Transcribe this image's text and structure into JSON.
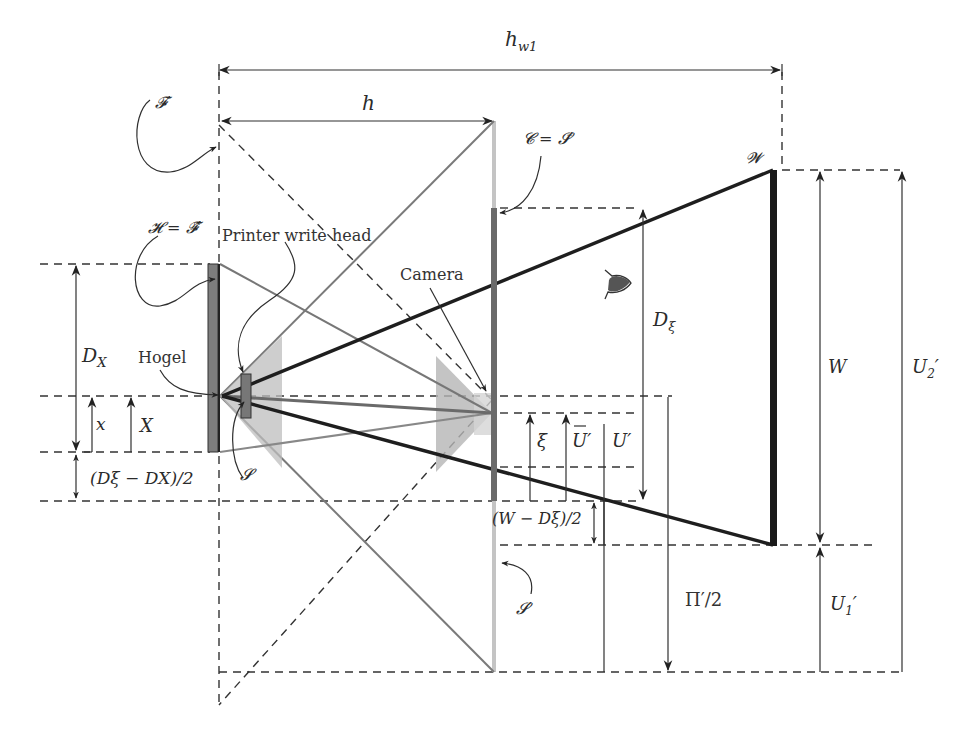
{
  "labels": {
    "hw1": "h",
    "hw1_sub": "w1",
    "h": "h",
    "F_prime": "𝓕′",
    "H_eq": "𝓗 = 𝓕̂′",
    "printer_write_head": "Printer write head",
    "hogel": "Hogel",
    "S": "𝓢",
    "camera": "Camera",
    "C_eq": "𝓒 = 𝓢̄′",
    "W_script": "𝓦",
    "S_prime": "𝓢′",
    "D_X": "D",
    "D_X_sub": "X",
    "x": "x",
    "X": "X",
    "dxi_minus_dx_over_2": "(Dξ − DX)/2",
    "D_xi": "D",
    "D_xi_sub": "ξ",
    "xi": "ξ",
    "U_bar_prime": "U′",
    "U_prime": "U′",
    "W_minus_Dxi_over_2": "(W − Dξ)/2",
    "Pi_prime_over_2": "Π′/2",
    "W": "W",
    "U2_prime": "U",
    "U2_sub": "2",
    "U2_mark": "′",
    "U1_prime": "U",
    "U1_sub": "1",
    "U1_mark": "′"
  },
  "colors": {
    "ink": "#2b2b2b",
    "hologram_bar": "#7d7d7d",
    "camera_bar": "#6a6a6a",
    "camera_plane_light": "#c4c4c4",
    "W_bar": "#1a1a1a",
    "cone_fill": "#b8b8b8",
    "eye_fill": "#555555"
  }
}
